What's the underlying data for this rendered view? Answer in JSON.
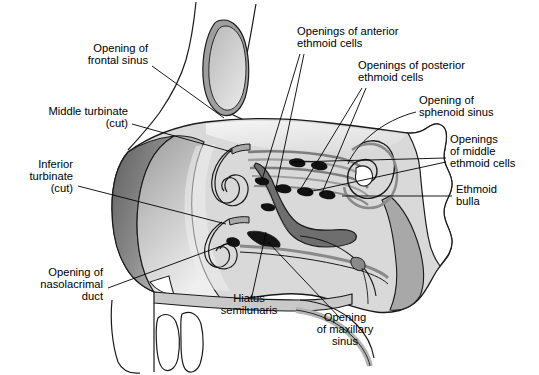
{
  "figure": {
    "type": "anatomical-illustration",
    "background": "#ffffff"
  },
  "palette": {
    "outline": "#1a1a1a",
    "body_fill": "#d9d9d9",
    "mucosa_light": "#e8e8e8",
    "mucosa_mid": "#b5b5b5",
    "mucosa_dark": "#8a8a8a",
    "shadow_dark": "#6e6e6e",
    "opening_black": "#111111",
    "white": "#ffffff",
    "leader_line": "#000000",
    "text": "#000000"
  },
  "labels": [
    {
      "id": "opening-of-frontal-sinus",
      "lines": [
        "Opening of",
        "frontal sinus"
      ],
      "anchor": "end",
      "x": 148,
      "y": 55
    },
    {
      "id": "middle-turbinate-cut",
      "lines": [
        "Middle turbinate",
        "(cut)"
      ],
      "anchor": "end",
      "x": 128,
      "y": 118
    },
    {
      "id": "inferior-turbinate-cut",
      "lines": [
        "Inferior",
        "turbinate",
        "(cut)"
      ],
      "anchor": "end",
      "x": 73,
      "y": 177
    },
    {
      "id": "opening-of-nasolacrimal-duct",
      "lines": [
        "Opening of",
        "nasolacrimal",
        "duct"
      ],
      "anchor": "end",
      "x": 103,
      "y": 285
    },
    {
      "id": "hiatus-semilunaris",
      "lines": [
        "Hiatus",
        "semilunaris",
        ""
      ],
      "anchor": "middle",
      "x": 249,
      "y": 305
    },
    {
      "id": "opening-of-maxillary-sinus",
      "lines": [
        "Opening",
        "of maxillary",
        "sinus"
      ],
      "anchor": "middle",
      "x": 345,
      "y": 330
    },
    {
      "id": "openings-of-anterior-ethmoid-cells",
      "lines": [
        "Openings of anterior",
        "ethmoid cells"
      ],
      "anchor": "start",
      "x": 297,
      "y": 38
    },
    {
      "id": "openings-of-posterior-ethmoid-cells",
      "lines": [
        "Openings of posterior",
        "ethmoid cells"
      ],
      "anchor": "start",
      "x": 358,
      "y": 72
    },
    {
      "id": "opening-of-sphenoid-sinus",
      "lines": [
        "Opening of",
        "sphenoid sinus"
      ],
      "anchor": "start",
      "x": 419,
      "y": 107
    },
    {
      "id": "openings-of-middle-ethmoid-cells",
      "lines": [
        "Openings",
        "of middle",
        "ethmoid cells"
      ],
      "anchor": "start",
      "x": 450,
      "y": 152
    },
    {
      "id": "ethmoid-bulla",
      "lines": [
        "Ethmoid",
        "bulla",
        ""
      ],
      "anchor": "start",
      "x": 456,
      "y": 196
    }
  ],
  "structures": [
    {
      "id": "frontal-sinus",
      "name": "Frontal sinus cavity"
    },
    {
      "id": "nasal-vestibule",
      "name": "Nasal vestibule"
    },
    {
      "id": "middle-turbinate-scroll",
      "name": "Middle turbinate cut scroll"
    },
    {
      "id": "inferior-turbinate-scroll",
      "name": "Inferior turbinate cut scroll"
    },
    {
      "id": "ethmoid-bulla-body",
      "name": "Ethmoid bulla"
    },
    {
      "id": "sphenoid-sinus-body",
      "name": "Sphenoid sinus region"
    },
    {
      "id": "hard-palate",
      "name": "Hard palate"
    },
    {
      "id": "incisor-teeth",
      "name": "Incisor teeth"
    },
    {
      "id": "soft-palate",
      "name": "Soft palate"
    },
    {
      "id": "sinus-openings",
      "name": "Sinus ostia openings"
    }
  ]
}
